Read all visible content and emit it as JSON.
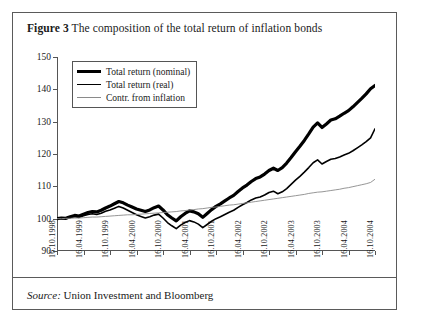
{
  "figure": {
    "label": "Figure 3",
    "title": "The composition of the total return of inflation bonds",
    "source_word": "Source:",
    "source_text": "Union Investment and Bloomberg"
  },
  "legend": {
    "items": [
      {
        "name": "Total  return (nominal)",
        "swatch": "thick-black-line",
        "color": "#000000",
        "width": 3.2
      },
      {
        "name": "Total return (real)",
        "swatch": "medium-black-line",
        "color": "#000000",
        "width": 1.6
      },
      {
        "name": "Contr. from inflation",
        "swatch": "thin-grey-line",
        "color": "#8a8a8a",
        "width": 0.9
      }
    ]
  },
  "chart_data": {
    "type": "line",
    "title": "The composition of the total return of inflation bonds",
    "xlabel": "",
    "ylabel": "",
    "ylim": [
      90,
      150
    ],
    "yticks": [
      90,
      100,
      110,
      120,
      130,
      140,
      150
    ],
    "grid": false,
    "legend_position": "top-left",
    "xticks": [
      "16.10.1998",
      "16.04.1999",
      "16.10.1999",
      "16.04.2000",
      "16.10.2000",
      "16.04.2001",
      "16.10.2001",
      "16.04.2002",
      "16.10.2002",
      "16.04.2003",
      "16.10.2003",
      "16.04.2004",
      "16.10.2004"
    ],
    "x": [
      0,
      1,
      2,
      3,
      4,
      5,
      6,
      7,
      8,
      9,
      10,
      11,
      12,
      13,
      14,
      15,
      16,
      17,
      18,
      19,
      20,
      21,
      22,
      23,
      24,
      25,
      26,
      27,
      28,
      29,
      30,
      31,
      32,
      33,
      34,
      35,
      36,
      37,
      38,
      39,
      40,
      41,
      42,
      43,
      44,
      45,
      46,
      47,
      48,
      49,
      50,
      51,
      52,
      53,
      54,
      55,
      56,
      57,
      58,
      59,
      60,
      61,
      62,
      63,
      64,
      65,
      66,
      67,
      68,
      69,
      70,
      71,
      72
    ],
    "series": [
      {
        "name": "Total  return (nominal)",
        "color": "#000000",
        "width": 3.2,
        "values": [
          100,
          100.2,
          100.1,
          100.6,
          101,
          100.8,
          101.4,
          101.9,
          102.2,
          102.1,
          102.6,
          103.3,
          103.9,
          104.6,
          105.3,
          104.9,
          104.2,
          103.6,
          103,
          102.6,
          102.2,
          102.7,
          103.4,
          103.9,
          102.7,
          101.2,
          100.2,
          99.3,
          100.6,
          101.6,
          102.4,
          102.1,
          101.5,
          100.4,
          101.6,
          102.8,
          103.8,
          104.6,
          105.5,
          106.4,
          107.2,
          108.4,
          109.5,
          110.4,
          111.5,
          112.4,
          112.9,
          113.8,
          114.9,
          115.6,
          114.9,
          115.8,
          117.2,
          118.9,
          120.7,
          122.4,
          124.2,
          126.2,
          128.3,
          129.6,
          128.2,
          129.3,
          130.5,
          130.9,
          131.7,
          132.6,
          133.4,
          134.6,
          135.9,
          137.2,
          138.6,
          140.2,
          141.2
        ]
      },
      {
        "name": "Total return (real)",
        "color": "#000000",
        "width": 1.6,
        "values": [
          100,
          100.1,
          100,
          100.4,
          100.7,
          100.4,
          100.9,
          101.3,
          101.5,
          101.3,
          101.7,
          102.3,
          102.7,
          103.2,
          103.8,
          103.3,
          102.6,
          101.9,
          101.2,
          100.7,
          100.2,
          100.6,
          101.1,
          101.4,
          100.2,
          98.8,
          97.8,
          96.9,
          98,
          98.8,
          99.4,
          99,
          98.3,
          97.2,
          98.2,
          99.2,
          100,
          100.6,
          101.3,
          102,
          102.6,
          103.5,
          104.3,
          105,
          105.8,
          106.4,
          106.7,
          107.3,
          108.1,
          108.5,
          107.7,
          108.3,
          109.3,
          110.6,
          111.9,
          113.1,
          114.4,
          115.8,
          117.3,
          118.2,
          116.9,
          117.7,
          118.4,
          118.6,
          119.1,
          119.7,
          120.2,
          121,
          121.9,
          122.8,
          123.8,
          125,
          127.8
        ]
      },
      {
        "name": "Contr. from inflation",
        "color": "#8a8a8a",
        "width": 0.9,
        "values": [
          100,
          100,
          100.1,
          100.1,
          100.2,
          100.2,
          100.3,
          100.4,
          100.5,
          100.5,
          100.6,
          100.7,
          100.8,
          100.9,
          101,
          101.1,
          101.2,
          101.2,
          101.3,
          101.4,
          101.5,
          101.6,
          101.7,
          101.8,
          101.9,
          102,
          102.1,
          102.2,
          102.4,
          102.5,
          102.7,
          102.8,
          103,
          103.1,
          103.3,
          103.5,
          103.6,
          103.8,
          104,
          104.2,
          104.3,
          104.5,
          104.7,
          104.9,
          105.1,
          105.3,
          105.5,
          105.7,
          105.9,
          106.1,
          106.3,
          106.5,
          106.7,
          106.9,
          107.1,
          107.3,
          107.5,
          107.8,
          108,
          108.2,
          108.3,
          108.5,
          108.7,
          108.9,
          109.1,
          109.4,
          109.6,
          109.9,
          110.2,
          110.5,
          110.8,
          111.2,
          112.2
        ]
      }
    ]
  }
}
